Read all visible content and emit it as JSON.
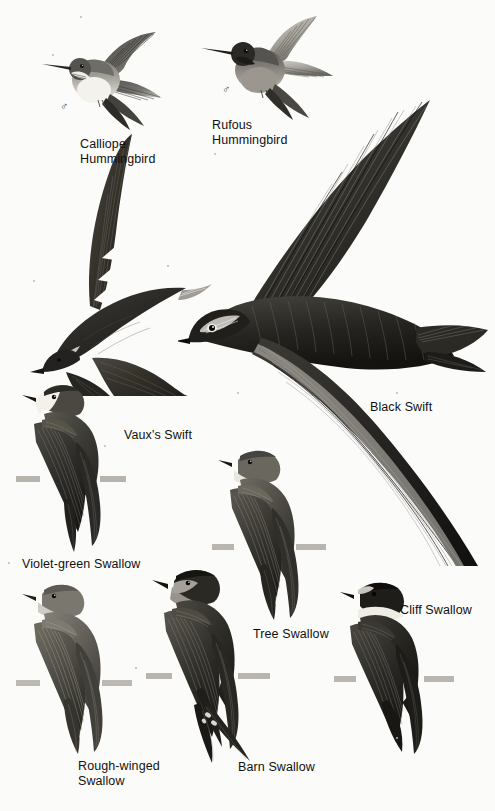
{
  "plate": {
    "title": "Swifts, Hummingbirds and Swallows field guide plate",
    "background_color": "#fbfbfa",
    "text_color": "#111111",
    "width": 495,
    "height": 811
  },
  "labels": [
    {
      "id": "calliope-hummingbird",
      "text": "Calliope\nHummingbird",
      "x": 80,
      "y": 137,
      "sex_symbol": "♂",
      "sex_x": 60,
      "sex_y": 108
    },
    {
      "id": "rufous-hummingbird",
      "text": "Rufous\nHummingbird",
      "x": 212,
      "y": 118,
      "sex_symbol": "♂",
      "sex_x": 222,
      "sex_y": 91
    },
    {
      "id": "vauxs-swift",
      "text": "Vaux's Swift",
      "x": 124,
      "y": 428,
      "sex_symbol": "",
      "sex_x": 0,
      "sex_y": 0
    },
    {
      "id": "black-swift",
      "text": "Black Swift",
      "x": 370,
      "y": 400,
      "sex_symbol": "",
      "sex_x": 0,
      "sex_y": 0
    },
    {
      "id": "violet-green-swallow",
      "text": "Violet-green Swallow",
      "x": 22,
      "y": 557,
      "sex_symbol": "",
      "sex_x": 0,
      "sex_y": 0
    },
    {
      "id": "tree-swallow",
      "text": "Tree Swallow",
      "x": 253,
      "y": 627,
      "sex_symbol": "",
      "sex_x": 0,
      "sex_y": 0
    },
    {
      "id": "cliff-swallow",
      "text": "Cliff Swallow",
      "x": 400,
      "y": 603,
      "sex_symbol": "",
      "sex_x": 0,
      "sex_y": 0
    },
    {
      "id": "rough-winged-swallow",
      "text": "Rough-winged\nSwallow",
      "x": 78,
      "y": 759,
      "sex_symbol": "",
      "sex_x": 0,
      "sex_y": 0
    },
    {
      "id": "barn-swallow",
      "text": "Barn Swallow",
      "x": 238,
      "y": 760,
      "sex_symbol": "",
      "sex_x": 0,
      "sex_y": 0
    }
  ],
  "figures": [
    {
      "id": "calliope-hummingbird-figure",
      "common_name": "Calliope Hummingbird",
      "group": "hummingbird",
      "pose": "hovering",
      "plumage": "pale underparts, streaked gorget, dark wings",
      "x": 38,
      "y": 28,
      "w": 140,
      "h": 110
    },
    {
      "id": "rufous-hummingbird-figure",
      "common_name": "Rufous Hummingbird",
      "group": "hummingbird",
      "pose": "hovering",
      "plumage": "dark head and gorget, rufous body, pale wings",
      "x": 195,
      "y": 14,
      "w": 145,
      "h": 115
    },
    {
      "id": "vauxs-swift-figure",
      "common_name": "Vaux's Swift",
      "group": "swift",
      "pose": "in flight, wings raised",
      "plumage": "sooty brown, paler throat",
      "x": 14,
      "y": 128,
      "w": 205,
      "h": 265
    },
    {
      "id": "black-swift-figure",
      "common_name": "Black Swift",
      "group": "swift",
      "pose": "in flight, long scythe wings",
      "plumage": "blackish, slight forehead pale",
      "x": 178,
      "y": 80,
      "w": 315,
      "h": 485
    },
    {
      "id": "violet-green-swallow-figure",
      "common_name": "Violet-green Swallow",
      "group": "swallow",
      "pose": "perched, side view",
      "plumage": "white face and flank patches, dark green back",
      "x": 14,
      "y": 380,
      "w": 125,
      "h": 175
    },
    {
      "id": "tree-swallow-figure",
      "common_name": "Tree Swallow",
      "group": "swallow",
      "pose": "perched, side view",
      "plumage": "glossy dark above, white below",
      "x": 212,
      "y": 448,
      "w": 122,
      "h": 175
    },
    {
      "id": "cliff-swallow-figure",
      "common_name": "Cliff Swallow",
      "group": "swallow",
      "pose": "perched, side view",
      "plumage": "pale collar, buff rump, dark cap",
      "x": 334,
      "y": 578,
      "w": 128,
      "h": 180
    },
    {
      "id": "rough-winged-swallow-figure",
      "common_name": "Rough-winged Swallow",
      "group": "swallow",
      "pose": "perched, side view",
      "plumage": "plain brown above, dusky throat",
      "x": 16,
      "y": 580,
      "w": 125,
      "h": 175
    },
    {
      "id": "barn-swallow-figure",
      "common_name": "Barn Swallow",
      "group": "swallow",
      "pose": "perched, side view, forked tail",
      "plumage": "dark blue above, rufous throat, long tail streamers",
      "x": 146,
      "y": 565,
      "w": 135,
      "h": 200
    }
  ],
  "specks": [
    {
      "x": 52,
      "y": 54
    },
    {
      "x": 80,
      "y": 16
    },
    {
      "x": 214,
      "y": 153
    },
    {
      "x": 33,
      "y": 280
    },
    {
      "x": 167,
      "y": 265
    },
    {
      "x": 104,
      "y": 445
    },
    {
      "x": 237,
      "y": 392
    },
    {
      "x": 396,
      "y": 392
    },
    {
      "x": 8,
      "y": 562
    },
    {
      "x": 135,
      "y": 667
    },
    {
      "x": 462,
      "y": 613
    },
    {
      "x": 396,
      "y": 737
    }
  ]
}
